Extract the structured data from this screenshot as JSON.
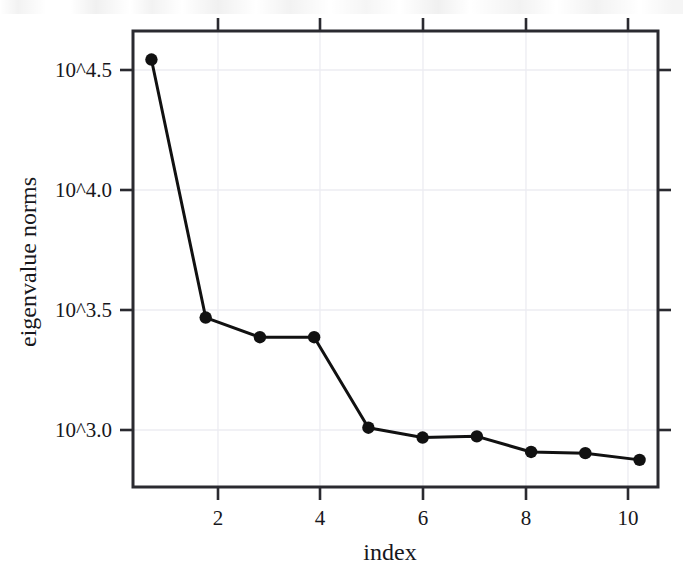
{
  "chart_data": {
    "type": "line",
    "title": "",
    "subtitle": "",
    "xlabel": "index",
    "ylabel": "eigenvalue norms",
    "x": [
      1,
      2,
      3,
      4,
      5,
      6,
      7,
      8,
      9,
      10
    ],
    "values": [
      34900,
      2940,
      2430,
      2430,
      1020,
      930,
      940,
      810,
      800,
      750
    ],
    "log10_values": [
      4.543,
      3.468,
      3.386,
      3.386,
      3.009,
      2.968,
      2.973,
      2.908,
      2.903,
      2.875
    ],
    "series": [
      {
        "name": "eigenvalue norms",
        "log10_values": [
          4.543,
          3.468,
          3.386,
          3.386,
          3.009,
          2.968,
          2.973,
          2.908,
          2.903,
          2.875
        ]
      }
    ],
    "yscale": "log10",
    "ylim_log10": [
      2.762,
      4.662
    ],
    "xlim": [
      0.66,
      10.34
    ],
    "grid": true,
    "legend": "none",
    "marker": "filled-circle",
    "line_color": "#111111",
    "marker_color": "#111111",
    "grid_color": "#ececf2",
    "frame_color": "#2a2a30",
    "ytick_labels": [
      "10^4.5",
      "10^4.0",
      "10^3.5",
      "10^3.0"
    ],
    "ytick_log10": [
      4.5,
      4.0,
      3.5,
      3.0
    ],
    "xtick_labels": [
      "2",
      "4",
      "6",
      "8",
      "10"
    ],
    "xtick_values": [
      2,
      4,
      6,
      8,
      10
    ]
  },
  "axes": {
    "x_title": "index",
    "y_title": "eigenvalue norms",
    "y_ticks": [
      {
        "label": "10^4.5"
      },
      {
        "label": "10^4.0"
      },
      {
        "label": "10^3.5"
      },
      {
        "label": "10^3.0"
      }
    ],
    "x_ticks": [
      {
        "label": "2"
      },
      {
        "label": "4"
      },
      {
        "label": "6"
      },
      {
        "label": "8"
      },
      {
        "label": "10"
      }
    ]
  }
}
